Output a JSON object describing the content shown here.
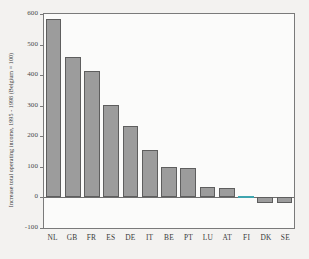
{
  "chart_data": {
    "type": "bar",
    "title": "",
    "xlabel": "",
    "ylabel": "Increase total operating income, 1995 - 1998 (Belgium = 100)",
    "categories": [
      "NL",
      "GB",
      "FR",
      "ES",
      "DE",
      "IT",
      "BE",
      "PT",
      "LU",
      "AT",
      "FI",
      "DK",
      "SE"
    ],
    "values": [
      585,
      458,
      412,
      303,
      234,
      155,
      100,
      96,
      35,
      30,
      5,
      -18,
      -18
    ],
    "series": [
      {
        "name": "Increase total operating income, 1995 - 1998 (Belgium = 100)",
        "values": [
          585,
          458,
          412,
          303,
          234,
          155,
          100,
          96,
          35,
          30,
          5,
          -18,
          -18
        ]
      }
    ],
    "ylim": [
      -100,
      600
    ],
    "yticks": [
      600,
      500,
      400,
      300,
      200,
      100,
      0,
      -100
    ],
    "ytick_labels": [
      "600",
      "500",
      "400",
      "300",
      "200",
      "100",
      "0",
      "-100"
    ],
    "grid": false,
    "legend": "none",
    "bar_color": "#9c9c9c",
    "bar_edge_color": "#5e5e5e",
    "highlight_color": "#62c9d2",
    "highlight_category": "FI",
    "background_color": "#f3f2f0",
    "plot_background_color": "#fbfbfa",
    "axis_color": "#7a7a7a"
  },
  "axes": {
    "y_title": "Increase total operating income, 1995 - 1998 (Belgium = 100)"
  }
}
